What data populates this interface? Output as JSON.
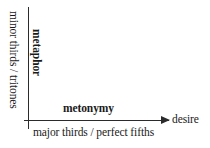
{
  "diagram": {
    "type": "two-axis-conceptual-plot",
    "title": "",
    "axes": {
      "x": {
        "name": "desire",
        "arrow": true,
        "arrow_direction": "right",
        "inner_label": "metonymy",
        "inner_label_style": "bold",
        "outer_label": "major thirds / perfect fifths",
        "outer_label_position": "below-axis"
      },
      "y": {
        "name": "",
        "arrow": false,
        "inner_label": "metaphor",
        "inner_label_style": "bold",
        "inner_label_rotation": "90deg",
        "outer_label": "minor thirds / tritones",
        "outer_label_position": "left-of-axis",
        "outer_label_rotation": "90deg"
      }
    },
    "colors": {
      "background": "#ffffff",
      "axis_line": "#2b2b2b",
      "text": "#1a1a1a"
    }
  }
}
